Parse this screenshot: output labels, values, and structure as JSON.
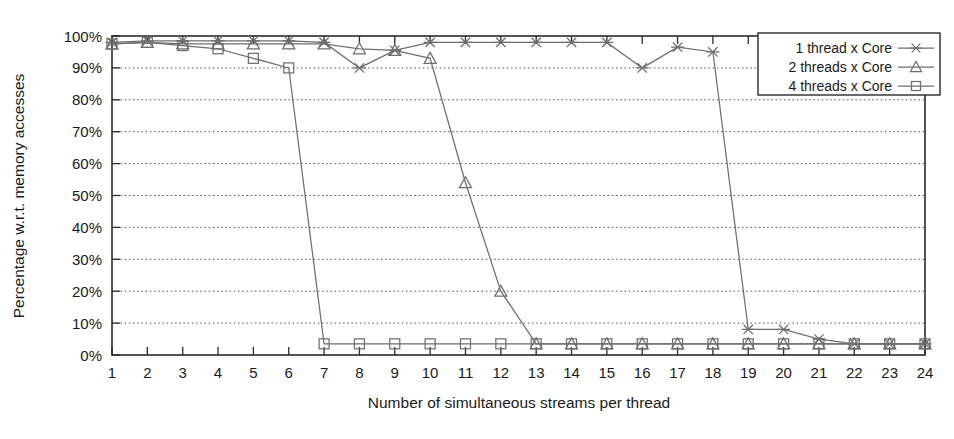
{
  "chart_data": {
    "type": "line",
    "title": "",
    "xlabel": "Number of simultaneous streams per thread",
    "ylabel": "Percentage w.r.t. memory accesses",
    "x": [
      1,
      2,
      3,
      4,
      5,
      6,
      7,
      8,
      9,
      10,
      11,
      12,
      13,
      14,
      15,
      16,
      17,
      18,
      19,
      20,
      21,
      22,
      23,
      24
    ],
    "xtick_labels": [
      "1",
      "2",
      "3",
      "4",
      "5",
      "6",
      "7",
      "8",
      "9",
      "10",
      "11",
      "12",
      "13",
      "14",
      "15",
      "16",
      "17",
      "18",
      "19",
      "20",
      "21",
      "22",
      "23",
      "24"
    ],
    "ytick_labels": [
      "0%",
      "10%",
      "20%",
      "30%",
      "40%",
      "50%",
      "60%",
      "70%",
      "80%",
      "90%",
      "100%"
    ],
    "ytick_values": [
      0,
      10,
      20,
      30,
      40,
      50,
      60,
      70,
      80,
      90,
      100
    ],
    "xlim": [
      1,
      24
    ],
    "ylim": [
      0,
      100
    ],
    "grid": true,
    "grid_axis": "y",
    "legend_position": "top-right",
    "series": [
      {
        "name": "1 thread x Core",
        "marker": "asterisk",
        "color": "#6e6e6e",
        "values": [
          98,
          98.5,
          98.5,
          98.5,
          98.5,
          98.5,
          98,
          90,
          95.5,
          98,
          98,
          98,
          98,
          98,
          98,
          90,
          96.5,
          95,
          8,
          8,
          5,
          3.5,
          3.5,
          3.5
        ]
      },
      {
        "name": "2 threads x Core",
        "marker": "triangle",
        "color": "#6e6e6e",
        "values": [
          97.5,
          98,
          97.5,
          97.5,
          97.5,
          97.5,
          97.5,
          96,
          95.5,
          93,
          54,
          20,
          3.5,
          3.5,
          3.5,
          3.5,
          3.5,
          3.5,
          3.5,
          3.5,
          3.5,
          3.5,
          3.5,
          3.5
        ]
      },
      {
        "name": "4 threads x Core",
        "marker": "square",
        "color": "#6e6e6e",
        "values": [
          97.5,
          98,
          97,
          96,
          93,
          90,
          3.5,
          3.5,
          3.5,
          3.5,
          3.5,
          3.5,
          3.5,
          3.5,
          3.5,
          3.5,
          3.5,
          3.5,
          3.5,
          3.5,
          3.5,
          3.5,
          3.5,
          3.5
        ]
      }
    ]
  },
  "colors": {
    "axis": "#2a2a2a",
    "grid": "#5a5a5a",
    "series": "#6e6e6e",
    "background": "#ffffff"
  }
}
